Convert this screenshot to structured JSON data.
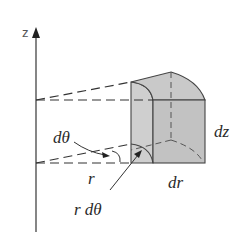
{
  "diagram": {
    "labels": {
      "z_axis": "z",
      "dtheta": "dθ",
      "r": "r",
      "r_dtheta": "r dθ",
      "dr": "dr",
      "dz": "dz"
    },
    "colors": {
      "stroke": "#3a3a3a",
      "face_light": "#d4d4d4",
      "face_dark": "#bdbdbd",
      "background": "#ffffff"
    }
  }
}
